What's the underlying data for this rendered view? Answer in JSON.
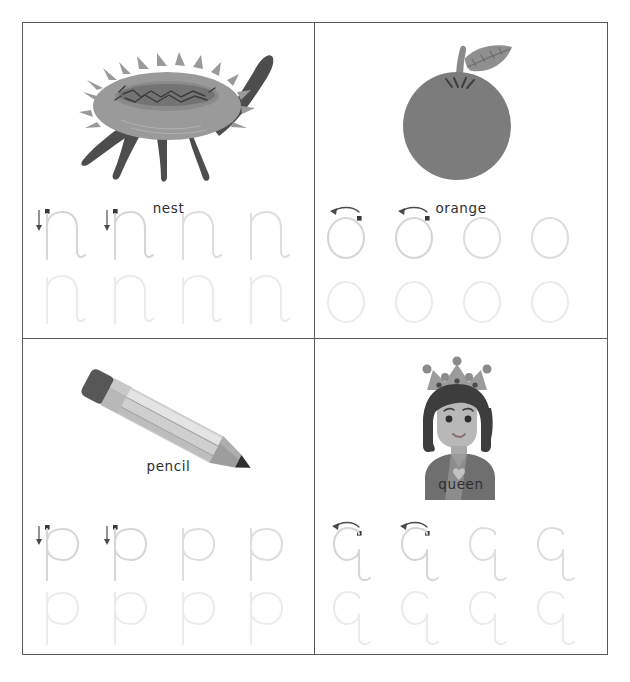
{
  "worksheet": {
    "title": "Letter tracing practice worksheet",
    "frame_color": "#5a5a5e",
    "background": "#ffffff",
    "trace_color_row1": "#d6d6d8",
    "trace_color_row2": "#ebebed",
    "guide_color": "#4a4a4e",
    "label_color": "#2e2e32",
    "grid": {
      "columns": 2,
      "rows": 2
    }
  },
  "cells": [
    {
      "id": "cell-nest",
      "position": "top-left",
      "letter": "n",
      "word": "nest",
      "picture": "nest-illustration",
      "stroke_guide": {
        "type": "down-arrow",
        "dot": "top-of-stem",
        "direction": "down"
      },
      "rows": [
        {
          "count": 4,
          "guides_on": 2,
          "shade": "row1"
        },
        {
          "count": 4,
          "guides_on": 0,
          "shade": "row2"
        }
      ]
    },
    {
      "id": "cell-orange",
      "position": "top-right",
      "letter": "o",
      "word": "orange",
      "picture": "orange-illustration",
      "stroke_guide": {
        "type": "curved-left-arrow",
        "dot": "top-right",
        "direction": "counter-clockwise"
      },
      "rows": [
        {
          "count": 4,
          "guides_on": 2,
          "shade": "row1"
        },
        {
          "count": 4,
          "guides_on": 0,
          "shade": "row2"
        }
      ]
    },
    {
      "id": "cell-pencil",
      "position": "bottom-left",
      "letter": "p",
      "word": "pencil",
      "picture": "pencil-illustration",
      "stroke_guide": {
        "type": "down-arrow",
        "dot": "top-of-stem",
        "direction": "down"
      },
      "rows": [
        {
          "count": 4,
          "guides_on": 2,
          "shade": "row1"
        },
        {
          "count": 4,
          "guides_on": 0,
          "shade": "row2"
        }
      ]
    },
    {
      "id": "cell-queen",
      "position": "bottom-right",
      "letter": "q",
      "word": "queen",
      "picture": "queen-illustration",
      "stroke_guide": {
        "type": "curved-left-arrow",
        "dot": "top-right",
        "direction": "counter-clockwise"
      },
      "rows": [
        {
          "count": 4,
          "guides_on": 2,
          "shade": "row1"
        },
        {
          "count": 4,
          "guides_on": 0,
          "shade": "row2"
        }
      ]
    }
  ],
  "illustration_colors": {
    "nest_body": "#9a9a9a",
    "nest_branch": "#4d4d4d",
    "nest_rim": "#8a8a8a",
    "orange_fruit": "#7c7c7c",
    "orange_leaf": "#8f8f8f",
    "orange_stem": "#8a8a8a",
    "pencil_barrel": "#cfcfcf",
    "pencil_barrel_light": "#e4e4e4",
    "pencil_eraser": "#575757",
    "pencil_ferrule": "#b8b8b8",
    "pencil_wood": "#9d9d9d",
    "pencil_tip": "#2f2f2f",
    "queen_crown": "#9b9b9b",
    "queen_hair": "#3d3d3d",
    "queen_skin": "#b8b8b8",
    "queen_robe": "#6f6f6f",
    "queen_sash": "#8c8c8c"
  }
}
